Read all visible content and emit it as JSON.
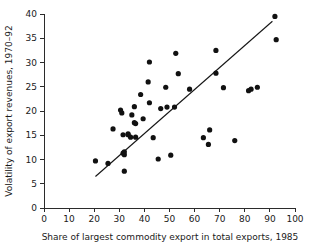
{
  "chart_data": {
    "type": "scatter",
    "title": "",
    "xlabel": "Share of largest commodity export in total exports, 1985",
    "ylabel": "Volatility of export revenues, 1970–92",
    "xlim": [
      0,
      100
    ],
    "ylim": [
      0,
      40
    ],
    "xticks": [
      0,
      10,
      20,
      30,
      40,
      50,
      60,
      70,
      80,
      90,
      100
    ],
    "yticks": [
      0,
      5,
      10,
      15,
      20,
      25,
      30,
      35,
      40
    ],
    "xtick_labels": [
      "0",
      "10",
      "20",
      "30",
      "40",
      "50",
      "60",
      "70",
      "80",
      "90",
      "100"
    ],
    "ytick_labels": [
      "0",
      "5",
      "10",
      "15",
      "20",
      "25",
      "30",
      "35",
      "40"
    ],
    "grid": false,
    "legend": null,
    "marker": "filled-circle",
    "marker_color": "#111111",
    "point_count": 45,
    "points": [
      [
        20.5,
        9.7
      ],
      [
        25.5,
        9.2
      ],
      [
        27.5,
        16.3
      ],
      [
        30.5,
        20.2
      ],
      [
        31.0,
        19.6
      ],
      [
        31.5,
        15.1
      ],
      [
        31.5,
        11.3
      ],
      [
        32.0,
        11.0
      ],
      [
        32.0,
        11.6
      ],
      [
        32.0,
        7.6
      ],
      [
        33.5,
        15.3
      ],
      [
        33.5,
        15.1
      ],
      [
        34.5,
        14.6
      ],
      [
        35.0,
        19.2
      ],
      [
        36.0,
        20.9
      ],
      [
        36.0,
        17.6
      ],
      [
        36.5,
        17.4
      ],
      [
        36.5,
        14.6
      ],
      [
        38.5,
        23.4
      ],
      [
        39.5,
        18.4
      ],
      [
        42.0,
        30.1
      ],
      [
        41.5,
        26.0
      ],
      [
        42.0,
        21.7
      ],
      [
        43.5,
        14.5
      ],
      [
        45.5,
        10.1
      ],
      [
        46.5,
        20.5
      ],
      [
        48.5,
        24.9
      ],
      [
        49.0,
        20.8
      ],
      [
        50.5,
        10.9
      ],
      [
        52.0,
        20.8
      ],
      [
        52.5,
        31.9
      ],
      [
        53.5,
        27.7
      ],
      [
        58.0,
        24.5
      ],
      [
        63.5,
        14.5
      ],
      [
        65.5,
        13.1
      ],
      [
        66.0,
        16.1
      ],
      [
        68.5,
        32.5
      ],
      [
        68.5,
        27.8
      ],
      [
        71.5,
        24.8
      ],
      [
        76.0,
        13.9
      ],
      [
        81.5,
        24.2
      ],
      [
        82.5,
        24.5
      ],
      [
        85.0,
        24.9
      ],
      [
        92.0,
        39.5
      ],
      [
        92.5,
        34.7
      ]
    ],
    "trend_line": {
      "label": "fitted regression line",
      "x_start": 20.5,
      "y_start": 6.5,
      "x_end": 91.0,
      "y_end": 38.5
    }
  }
}
